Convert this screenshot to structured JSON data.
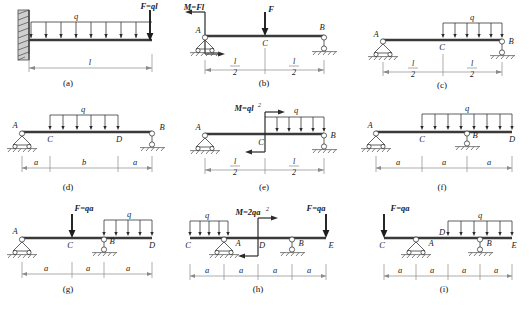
{
  "figure": {
    "title": "",
    "panel_count": 9,
    "captions": [
      "(a)",
      "(b)",
      "(c)",
      "(d)",
      "(e)",
      "(f)",
      "(g)",
      "(h)",
      "(i)"
    ]
  },
  "panels": [
    {
      "id": "a",
      "caption": "(a)",
      "support_left": "fixed-wall",
      "support_right": "none",
      "distributed_load": "q",
      "point_loads": [
        {
          "label": "F=ql",
          "at": "free-end",
          "direction": "down"
        }
      ],
      "moments": [],
      "node_labels": [],
      "dimensions": [
        {
          "label": "l"
        }
      ]
    },
    {
      "id": "b",
      "caption": "(b)",
      "support_left": "pin",
      "support_right": "roller",
      "distributed_load": "",
      "point_loads": [
        {
          "label": "F",
          "at": "C",
          "direction": "down"
        }
      ],
      "moments": [
        {
          "label": "M=Fl",
          "at": "A",
          "sense": "couple"
        }
      ],
      "node_labels": [
        "A",
        "C",
        "B"
      ],
      "dimensions": [
        {
          "num": "l",
          "den": "2"
        },
        {
          "num": "l",
          "den": "2"
        }
      ]
    },
    {
      "id": "c",
      "caption": "(c)",
      "support_left": "pin",
      "support_right": "roller",
      "distributed_load": "q",
      "point_loads": [],
      "moments": [],
      "node_labels": [
        "A",
        "C",
        "B"
      ],
      "dimensions": [
        {
          "num": "l",
          "den": "2"
        },
        {
          "num": "l",
          "den": "2"
        }
      ]
    },
    {
      "id": "d",
      "caption": "(d)",
      "support_left": "pin",
      "support_right": "roller",
      "distributed_load": "q",
      "point_loads": [],
      "moments": [],
      "node_labels": [
        "A",
        "C",
        "D",
        "B"
      ],
      "dimensions": [
        {
          "label": "a"
        },
        {
          "label": "b"
        },
        {
          "label": "a"
        }
      ]
    },
    {
      "id": "e",
      "caption": "(e)",
      "support_left": "pin",
      "support_right": "roller",
      "distributed_load": "q",
      "point_loads": [],
      "moments": [
        {
          "label": "M=ql",
          "exponent": "2",
          "at": "C",
          "sense": "couple"
        }
      ],
      "node_labels": [
        "A",
        "C",
        "B"
      ],
      "dimensions": [
        {
          "num": "l",
          "den": "2"
        },
        {
          "num": "l",
          "den": "2"
        }
      ]
    },
    {
      "id": "f",
      "caption": "(f)",
      "support_left": "pin",
      "support_right": "none",
      "interior_support": "roller-at-B",
      "distributed_load": "q",
      "point_loads": [],
      "moments": [],
      "node_labels": [
        "A",
        "C",
        "B",
        "D"
      ],
      "dimensions": [
        {
          "label": "a"
        },
        {
          "label": "a"
        },
        {
          "label": "a"
        }
      ]
    },
    {
      "id": "g",
      "caption": "(g)",
      "support_left": "pin",
      "support_right": "none",
      "interior_support": "roller-at-B",
      "distributed_load": "q",
      "point_loads": [
        {
          "label": "F=qa",
          "at": "C",
          "direction": "down"
        }
      ],
      "moments": [],
      "node_labels": [
        "A",
        "C",
        "B",
        "D"
      ],
      "dimensions": [
        {
          "label": "a"
        },
        {
          "label": "a"
        },
        {
          "label": "a"
        }
      ]
    },
    {
      "id": "h",
      "caption": "(h)",
      "support_left": "pin-at-A",
      "support_right": "roller-at-B",
      "distributed_load": "q",
      "point_loads": [
        {
          "label": "F=qa",
          "at": "E",
          "direction": "down"
        }
      ],
      "moments": [
        {
          "label": "M=2qa",
          "exponent": "2",
          "at": "D",
          "sense": "couple"
        }
      ],
      "node_labels": [
        "C",
        "A",
        "D",
        "B",
        "E"
      ],
      "dimensions": [
        {
          "label": "a"
        },
        {
          "label": "a"
        },
        {
          "label": "a"
        },
        {
          "label": "a"
        }
      ]
    },
    {
      "id": "i",
      "caption": "(i)",
      "support_left": "pin-at-A",
      "support_right": "roller-at-B",
      "distributed_load": "q",
      "point_loads": [
        {
          "label": "F=qa",
          "at": "C",
          "direction": "down"
        }
      ],
      "moments": [],
      "node_labels": [
        "C",
        "A",
        "D",
        "B",
        "E"
      ],
      "dimensions": [
        {
          "label": "a"
        },
        {
          "label": "a"
        },
        {
          "label": "a"
        },
        {
          "label": "a"
        }
      ]
    }
  ]
}
